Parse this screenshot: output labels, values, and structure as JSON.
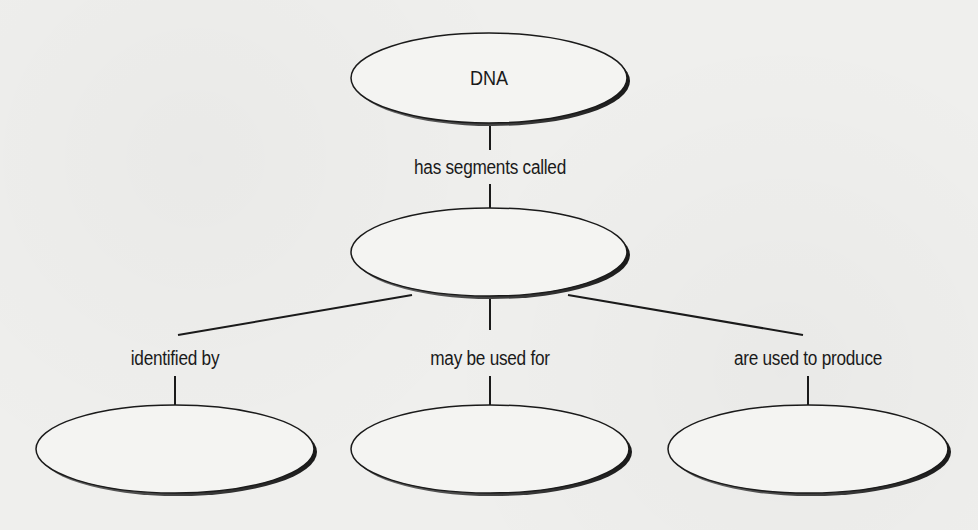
{
  "diagram": {
    "type": "concept-map",
    "nodes": [
      {
        "id": "dna",
        "text": "DNA",
        "cx": 490,
        "cy": 78
      },
      {
        "id": "segments",
        "text": "",
        "cx": 490,
        "cy": 252
      },
      {
        "id": "identified",
        "text": "",
        "cx": 175,
        "cy": 449
      },
      {
        "id": "uses",
        "text": "",
        "cx": 490,
        "cy": 449
      },
      {
        "id": "produce",
        "text": "",
        "cx": 808,
        "cy": 449
      }
    ],
    "links": [
      {
        "from": "dna",
        "to": "segments",
        "label": "has segments called"
      },
      {
        "from": "segments",
        "to": "identified",
        "label": "identified by"
      },
      {
        "from": "segments",
        "to": "uses",
        "label": "may be used for"
      },
      {
        "from": "segments",
        "to": "produce",
        "label": "are used to produce"
      }
    ],
    "colors": {
      "stroke": "#1a1a1a",
      "fill": "#f4f4f2",
      "shadow": "#3a3a3a",
      "text": "#1a1a1a"
    }
  }
}
